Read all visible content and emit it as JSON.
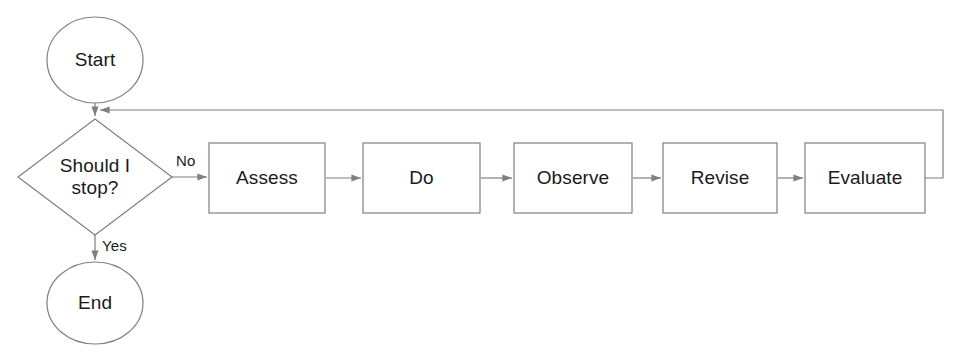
{
  "diagram": {
    "canvas": {
      "width": 965,
      "height": 354
    },
    "colors": {
      "background": "#ffffff",
      "stroke": "#7f7f7f",
      "text": "#1a1a1a"
    },
    "nodes": {
      "start": {
        "label": "Start",
        "shape": "ellipse"
      },
      "decision": {
        "label": "Should I\nstop?",
        "shape": "diamond"
      },
      "end": {
        "label": "End",
        "shape": "ellipse"
      },
      "assess": {
        "label": "Assess",
        "shape": "rectangle"
      },
      "do": {
        "label": "Do",
        "shape": "rectangle"
      },
      "observe": {
        "label": "Observe",
        "shape": "rectangle"
      },
      "revise": {
        "label": "Revise",
        "shape": "rectangle"
      },
      "evaluate": {
        "label": "Evaluate",
        "shape": "rectangle"
      }
    },
    "edge_labels": {
      "no": "No",
      "yes": "Yes"
    }
  }
}
